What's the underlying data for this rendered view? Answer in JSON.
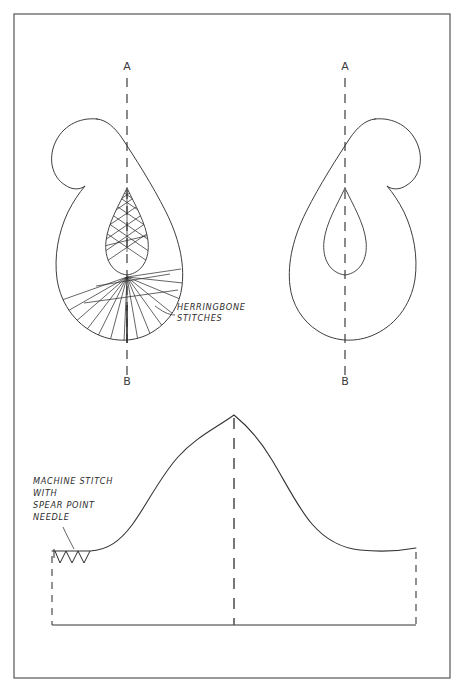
{
  "page": {
    "background_color": "#ffffff",
    "width": 465,
    "height": 695
  },
  "frame": {
    "name": "outer-border",
    "x": 14,
    "y": 14,
    "width": 436,
    "height": 664,
    "stroke_color": "#555555",
    "stroke_width": 1.2,
    "fill": "none"
  },
  "style": {
    "ink_color": "#2b2b2b",
    "line_color": "#333333",
    "dash_color": "#4a4a4a",
    "stroke_width": 0.9
  },
  "figures": {
    "top_left": {
      "name": "paisley-with-stitches",
      "description": "Paisley teardrop motif with hooked tail curling to the left, containing an inner pointed teardrop filled with herringbone crosshatch stitches in its upper half and radiating fan stitches below",
      "axis": {
        "top_label": "A",
        "bottom_label": "B",
        "top_label_x": 127,
        "top_label_y": 70,
        "bottom_label_x": 127,
        "bottom_label_y": 385,
        "line_x": 127,
        "line_top": 78,
        "line_bottom": 377,
        "dash_pattern": "9 7"
      },
      "hook_side": "left"
    },
    "top_right": {
      "name": "paisley-plain",
      "description": "Mirror-image paisley teardrop motif with hooked tail curling to the right, containing a plain inner pointed teardrop outline with no stitching",
      "axis": {
        "top_label": "A",
        "bottom_label": "B",
        "top_label_x": 345,
        "top_label_y": 70,
        "bottom_label_x": 345,
        "bottom_label_y": 385,
        "line_x": 345,
        "line_top": 78,
        "line_bottom": 377,
        "dash_pattern": "9 7"
      },
      "hook_side": "right"
    },
    "bottom": {
      "name": "pattern-piece-elevation",
      "description": "Flat pattern piece with a tall asymmetric peaked curve, a dashed centre fold line, dashed side seam lines and a solid base line; a zigzag machine-stitch symbol sits on the upper left horizontal edge",
      "peak_x": 234,
      "peak_y": 415,
      "base_y": 625,
      "left_x": 52,
      "right_x": 416,
      "left_shoulder_y": 551,
      "right_shoulder_y": 548,
      "center_fold_x": 234,
      "zigzag_count": 4
    }
  },
  "labels": {
    "herringbone": {
      "name": "herringbone-stitches-label",
      "lines": [
        "HERRINGBONE",
        "STITCHES"
      ],
      "x": 177,
      "y": 310,
      "line_height": 11,
      "leader": "curved line from label to lower-right edge of the stitched paisley"
    },
    "machine_stitch": {
      "name": "machine-stitch-label",
      "lines": [
        "MACHINE STITCH",
        "WITH",
        "SPEAR POINT",
        "NEEDLE"
      ],
      "x": 33,
      "y": 484,
      "line_height": 12,
      "leader": "short curved line from label down to the zigzag stitch symbol"
    },
    "section_marks": {
      "top": "A",
      "bottom": "B"
    }
  }
}
